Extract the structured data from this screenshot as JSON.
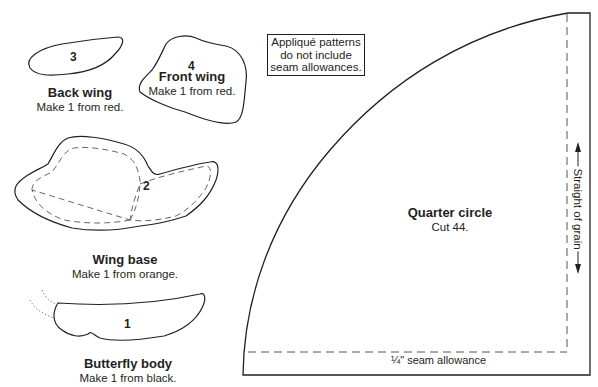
{
  "note": {
    "line1": "Appliqué patterns",
    "line2": "do not include",
    "line3": "seam allowances."
  },
  "pieces": [
    {
      "number": "3",
      "title": "Back wing",
      "instruction": "Make 1 from red."
    },
    {
      "number": "4",
      "title": "Front wing",
      "instruction": "Make 1 from red."
    },
    {
      "number": "2",
      "title": "Wing base",
      "instruction": "Make 1 from orange."
    },
    {
      "number": "1",
      "title": "Butterfly body",
      "instruction": "Make 1 from black."
    }
  ],
  "quarter_circle": {
    "title": "Quarter circle",
    "instruction": "Cut 44.",
    "grain_label": "Straight of grain",
    "seam_label": "¼\" seam allowance"
  },
  "colors": {
    "line": "#231f20",
    "dashed": "#555555",
    "background": "#ffffff"
  }
}
